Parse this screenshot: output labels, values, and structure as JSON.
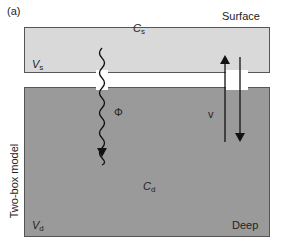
{
  "figure": {
    "panel_label": "(a)",
    "side_label": "Two-box model",
    "surface_box": {
      "name": "Surface",
      "volume_symbol": "V",
      "volume_sub": "s",
      "conc_symbol": "C",
      "conc_sub": "s",
      "fill": "#d9d9d9"
    },
    "deep_box": {
      "name": "Deep",
      "volume_symbol": "V",
      "volume_sub": "d",
      "conc_symbol": "C",
      "conc_sub": "d",
      "fill": "#9a9a9a"
    },
    "flux_label": "Φ",
    "exchange_label": "v"
  }
}
